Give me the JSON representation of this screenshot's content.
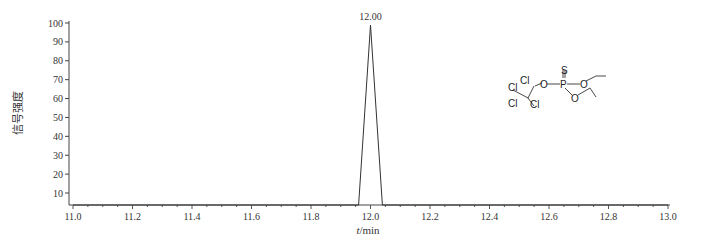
{
  "chart_data": {
    "type": "line",
    "title": "",
    "xlabel": "t/min",
    "xlabel_italic_part": "t",
    "xlabel_unit": "/min",
    "ylabel": "信号强度",
    "xlim": [
      11.0,
      13.0
    ],
    "ylim": [
      4,
      100
    ],
    "x_ticks": [
      "11.0",
      "11.2",
      "11.4",
      "11.6",
      "11.8",
      "12.0",
      "12.2",
      "12.4",
      "12.6",
      "12.8",
      "13.0"
    ],
    "y_ticks": [
      "10",
      "20",
      "30",
      "40",
      "50",
      "60",
      "70",
      "80",
      "90",
      "100"
    ],
    "grid": false,
    "legend": null,
    "series": [
      {
        "name": "chromatogram",
        "x": [
          11.0,
          11.96,
          12.0,
          12.04,
          13.0
        ],
        "y": [
          0,
          0,
          100,
          0,
          0
        ]
      }
    ],
    "annotations": [
      {
        "text": "12.00",
        "x": 12.0,
        "y": 100,
        "type": "peak-label"
      }
    ],
    "structure_labels": [
      "Cl",
      "Cl",
      "Cl",
      "Cl",
      "O",
      "P",
      "S",
      "O",
      "O"
    ]
  }
}
